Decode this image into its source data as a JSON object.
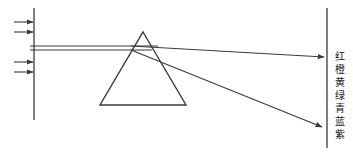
{
  "figure": {
    "stroke_color": "#3a3a3a",
    "background_color": "#ffffff",
    "text_color": "#1a1a1a"
  },
  "slit": {
    "name": "left vertical barrier",
    "x": 34,
    "y_top": 8,
    "y_bottom": 120
  },
  "screen": {
    "name": "right vertical screen",
    "x": 327,
    "y_top": 8,
    "y_bottom": 148
  },
  "prism": {
    "apex_x": 143,
    "apex_y": 32,
    "base_left_x": 100,
    "base_right_x": 186,
    "base_y": 105
  },
  "incoming_arrows": [
    {
      "x1": 14,
      "y1": 22,
      "x2": 34,
      "y2": 22
    },
    {
      "x1": 14,
      "y1": 32,
      "x2": 34,
      "y2": 32
    },
    {
      "x1": 14,
      "y1": 62,
      "x2": 34,
      "y2": 62
    },
    {
      "x1": 14,
      "y1": 72,
      "x2": 34,
      "y2": 72
    }
  ],
  "beam": {
    "upper_y": 46,
    "lower_y": 50,
    "start_x": 34,
    "entry_x": 131
  },
  "refracted_rays": [
    {
      "name": "red-ray",
      "x1": 131,
      "y1": 46,
      "x2": 325,
      "y2": 57
    },
    {
      "name": "violet-ray",
      "x1": 131,
      "y1": 50,
      "x2": 323,
      "y2": 127
    }
  ],
  "spectrum": {
    "label": "Spectrum colors",
    "colors": [
      {
        "ch": "红",
        "meaning": "red"
      },
      {
        "ch": "橙",
        "meaning": "orange"
      },
      {
        "ch": "黄",
        "meaning": "yellow"
      },
      {
        "ch": "绿",
        "meaning": "green"
      },
      {
        "ch": "青",
        "meaning": "cyan"
      },
      {
        "ch": "蓝",
        "meaning": "blue"
      },
      {
        "ch": "紫",
        "meaning": "violet"
      }
    ]
  }
}
